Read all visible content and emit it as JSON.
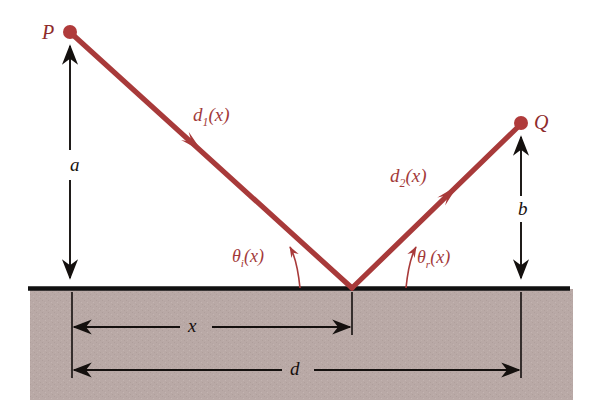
{
  "figure": {
    "labels": {
      "point_p": "P",
      "point_q": "Q",
      "path_incident_base": "d",
      "path_incident_sub": "1",
      "path_incident_arg": "(x)",
      "path_reflected_base": "d",
      "path_reflected_sub": "2",
      "path_reflected_arg": "(x)",
      "angle_incidence_base": "θ",
      "angle_incidence_sub": "i",
      "angle_incidence_arg": "(x)",
      "angle_reflection_base": "θ",
      "angle_reflection_sub": "r",
      "angle_reflection_arg": "(x)",
      "height_a": "a",
      "height_b": "b",
      "distance_x": "x",
      "distance_d": "d"
    },
    "colors": {
      "ray": "#a83a3a",
      "ray_dark": "#8e2b2b",
      "ground_fill": "#b9a9a6",
      "surface_line": "#111111",
      "dimension_line": "#14100e",
      "background": "#ffffff"
    },
    "geometry": {
      "point_p": {
        "x": 70,
        "y": 32
      },
      "point_q": {
        "x": 521,
        "y": 123
      },
      "reflection_point": {
        "x": 352,
        "y": 288
      },
      "surface_y": 288,
      "surface_left": 28,
      "surface_right": 570,
      "ground_bottom": 400,
      "foot_p_x": 70,
      "foot_q_x": 521,
      "x_dim_y": 327,
      "d_dim_y": 370
    }
  }
}
